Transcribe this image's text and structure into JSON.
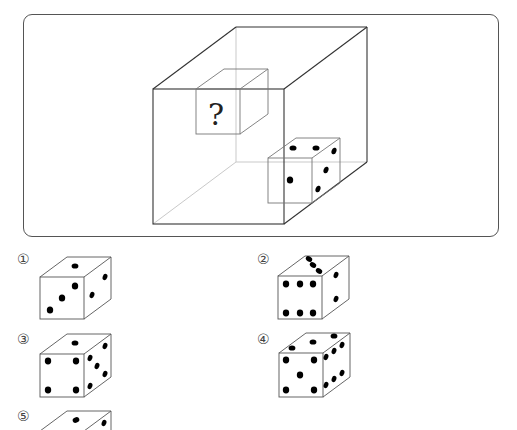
{
  "question": {
    "header_fragment": "",
    "main_figure": {
      "description": "Transparent large cube containing a smaller cube with a question mark face and a die placed at the bottom-right",
      "unknown_cube_label": "?",
      "reference_die": {
        "front_face_pips": 1,
        "top_face_pips": 2,
        "right_face_pips": 3
      }
    }
  },
  "options": [
    {
      "label": "①",
      "front_pips": 3,
      "top_pips": 1,
      "right_pips": 2
    },
    {
      "label": "②",
      "front_pips": 6,
      "top_pips": 3,
      "right_pips": 2
    },
    {
      "label": "③",
      "front_pips": 4,
      "top_pips": 1,
      "right_pips": 5
    },
    {
      "label": "④",
      "front_pips": 5,
      "top_pips": 3,
      "right_pips": 6
    },
    {
      "label": "⑤",
      "front_pips": null,
      "top_pips": 1,
      "right_pips": 1
    }
  ],
  "colors": {
    "line": "#333333",
    "hidden_line": "#c8c8c8",
    "pip": "#000000",
    "frame": "#555555"
  }
}
